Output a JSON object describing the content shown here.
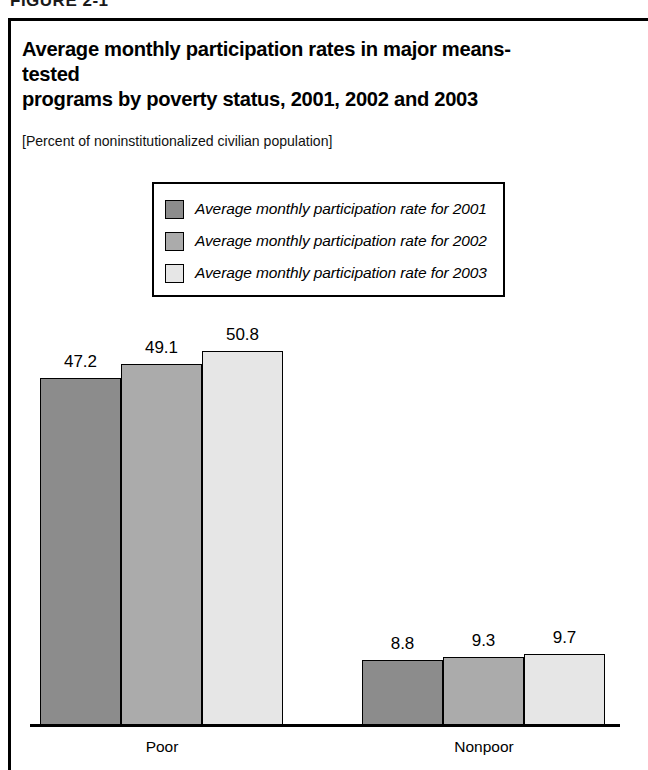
{
  "figure": {
    "header_label": "FIGURE 2-1",
    "title_line1": "Average monthly participation rates in major means-tested",
    "title_line2": "programs by poverty status, 2001, 2002 and 2003",
    "subtitle": "[Percent of noninstitutionalized civilian population]"
  },
  "legend": {
    "position": "inside-top-center",
    "items": [
      {
        "label": "Average monthly participation rate for 2001",
        "color": "#8c8c8c"
      },
      {
        "label": "Average monthly participation rate for 2002",
        "color": "#ababab"
      },
      {
        "label": "Average monthly participation rate for 2003",
        "color": "#e6e6e6"
      }
    ]
  },
  "chart_data": {
    "type": "bar",
    "title": "Average monthly participation rates in major means-tested programs by poverty status, 2001, 2002 and 2003",
    "subtitle": "[Percent of noninstitutionalized civilian population]",
    "xlabel": "",
    "ylabel": "",
    "ylim": [
      0,
      55
    ],
    "grid": false,
    "legend_position": "inside-top-center",
    "categories": [
      "Poor",
      "Nonpoor"
    ],
    "series": [
      {
        "name": "Average monthly participation rate for 2001",
        "color": "#8c8c8c",
        "values": [
          47.2,
          49.1
        ]
      },
      {
        "name": "Average monthly participation rate for 2002",
        "color": "#ababab",
        "values": [
          49.1,
          9.3
        ]
      },
      {
        "name": "Average monthly participation rate for 2003",
        "color": "#e6e6e6",
        "values": [
          50.8,
          9.7
        ]
      }
    ],
    "groups": [
      {
        "category": "Poor",
        "bars": [
          {
            "series": "Average monthly participation rate for 2001",
            "value": 47.2,
            "label": "47.2",
            "color": "#8c8c8c"
          },
          {
            "series": "Average monthly participation rate for 2002",
            "value": 49.1,
            "label": "49.1",
            "color": "#ababab"
          },
          {
            "series": "Average monthly participation rate for 2003",
            "value": 50.8,
            "label": "50.8",
            "color": "#e6e6e6"
          }
        ]
      },
      {
        "category": "Nonpoor",
        "bars": [
          {
            "series": "Average monthly participation rate for 2001",
            "value": 8.8,
            "label": "8.8",
            "color": "#8c8c8c"
          },
          {
            "series": "Average monthly participation rate for 2002",
            "value": 9.3,
            "label": "9.3",
            "color": "#ababab"
          },
          {
            "series": "Average monthly participation rate for 2003",
            "value": 9.7,
            "label": "9.7",
            "color": "#e6e6e6"
          }
        ]
      }
    ]
  },
  "layout": {
    "baseline_y": 725,
    "px_per_unit": 7.355,
    "bar_width": 81,
    "groups": [
      {
        "category": "Poor",
        "start_x": 40,
        "label_center_x": 162
      },
      {
        "category": "Nonpoor",
        "start_x": 362,
        "label_center_x": 484
      }
    ]
  }
}
